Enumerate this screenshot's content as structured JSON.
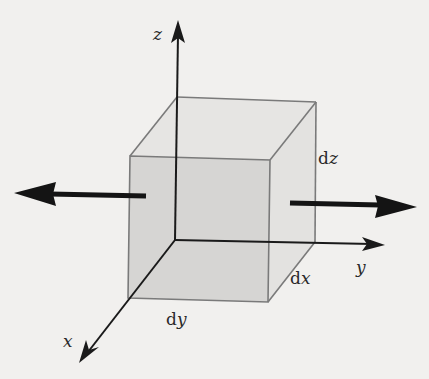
{
  "diagram": {
    "title": "",
    "axes": {
      "x": {
        "label": "x"
      },
      "y": {
        "label": "y"
      },
      "z": {
        "label": "z"
      }
    },
    "dimensions": {
      "dx": {
        "prefix": "d",
        "var": "x"
      },
      "dy": {
        "prefix": "d",
        "var": "y"
      },
      "dz": {
        "prefix": "d",
        "var": "z"
      }
    },
    "element": "infinitesimal cube (volume element)",
    "forces": [
      {
        "name": "left-force",
        "direction": "-y"
      },
      {
        "name": "right-force",
        "direction": "+y"
      }
    ],
    "colors": {
      "background": "#f1f0ee",
      "front_face": "#d6d5d3",
      "side_face": "#e3e2e0",
      "top_face": "#e6e5e3",
      "edge": "#7a7a7a",
      "axis": "#1a1a1a"
    }
  }
}
